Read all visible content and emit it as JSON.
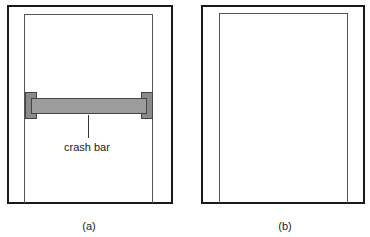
{
  "figure": {
    "panels": [
      {
        "id": "a",
        "caption": "(a)",
        "callout": "crash bar",
        "has_crash_bar": true
      },
      {
        "id": "b",
        "caption": "(b)",
        "has_crash_bar": false
      }
    ]
  },
  "colors": {
    "frame": "#1a1a1a",
    "door": "#555555",
    "crash_bar_fill": "#9c9c9c",
    "bracket_fill": "#8a8a8a"
  }
}
